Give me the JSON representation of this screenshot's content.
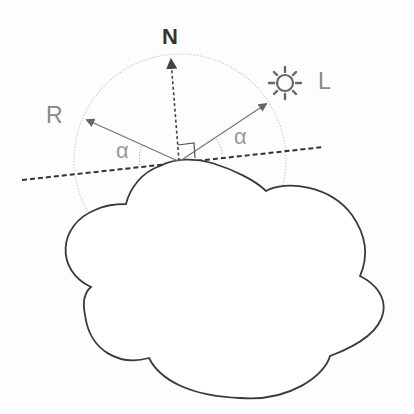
{
  "diagram": {
    "labels": {
      "normal": "N",
      "reflected": "R",
      "light": "L",
      "angle_left": "α",
      "angle_right": "α"
    },
    "icons": {
      "light_source": "sun-icon"
    },
    "colors": {
      "outline": "#3a3a3a",
      "arrow": "#777777",
      "circle": "#cfcfcf",
      "label": "#888888",
      "normal_label": "#333333"
    }
  }
}
